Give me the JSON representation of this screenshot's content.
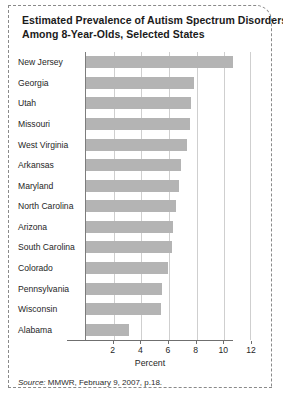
{
  "title": {
    "line1": "Estimated Prevalence of Autism Spectrum Disorders",
    "line2": "Among 8-Year-Olds, Selected States"
  },
  "source": {
    "prefix": "Source:",
    "text": "MMWR, February 9, 2007, p.18."
  },
  "colors": {
    "bar": "#b4b4b4",
    "grid": "#cfcfcf",
    "axis": "#6f6f6f",
    "frame": "#8a8a8a",
    "text": "#262626"
  },
  "chart_data": {
    "type": "bar",
    "orientation": "horizontal",
    "title": "Estimated Prevalence of Autism Spectrum Disorders Among 8-Year-Olds, Selected States",
    "xlabel": "Percent",
    "ylabel": "",
    "xlim": [
      0,
      12
    ],
    "xticks": [
      2,
      4,
      6,
      8,
      10,
      12
    ],
    "xticklabels": [
      "2",
      "4",
      "6",
      "8",
      "10",
      "12"
    ],
    "grid": "vertical",
    "legend": "none",
    "categories": [
      "New Jersey",
      "Georgia",
      "Utah",
      "Missouri",
      "West Virginia",
      "Arkansas",
      "Maryland",
      "North Carolina",
      "Arizona",
      "South Carolina",
      "Colorado",
      "Pennsylvania",
      "Wisconsin",
      "Alabama"
    ],
    "values": [
      10.6,
      7.8,
      7.6,
      7.5,
      7.3,
      6.9,
      6.7,
      6.5,
      6.3,
      6.2,
      5.9,
      5.5,
      5.4,
      3.1
    ]
  }
}
